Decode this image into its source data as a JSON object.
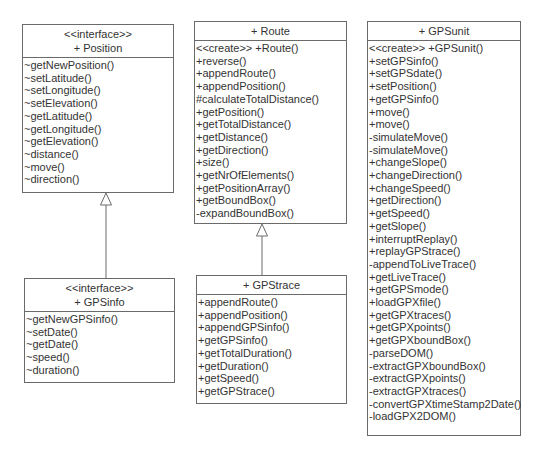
{
  "classes": {
    "position": {
      "stereotype": "<<interface>>",
      "name": "+ Position",
      "operations": [
        "~getNewPosition()",
        "~setLatitude()",
        "~setLongitude()",
        "~setElevation()",
        "~getLatitude()",
        "~getLongitude()",
        "~getElevation()",
        "~distance()",
        "~move()",
        "~direction()"
      ]
    },
    "gpsinfo": {
      "stereotype": "<<interface>>",
      "name": "+ GPSinfo",
      "operations": [
        "~getNewGPSinfo()",
        "~setDate()",
        "~getDate()",
        "~speed()",
        "~duration()"
      ]
    },
    "route": {
      "name": "+ Route",
      "operations": [
        "<<create>> +Route()",
        "+reverse()",
        "+appendRoute()",
        "+appendPosition()",
        "#calculateTotalDistance()",
        "+getPosition()",
        "+getTotalDistance()",
        "+getDistance()",
        "+getDirection()",
        "+size()",
        "+getNrOfElements()",
        "+getPositionArray()",
        "+getBoundBox()",
        "-expandBoundBox()"
      ]
    },
    "gpstrace": {
      "name": "+ GPStrace",
      "operations": [
        "+appendRoute()",
        "+appendPosition()",
        "+appendGPSinfo()",
        "+getGPSinfo()",
        "+getTotalDuration()",
        "+getDuration()",
        "+getSpeed()",
        "+getGPStrace()"
      ]
    },
    "gpsunit": {
      "name": "+ GPSunit",
      "operations": [
        "<<create>> +GPSunit()",
        "+setGPSinfo()",
        "+setGPSdate()",
        "+setPosition()",
        "+getGPSinfo()",
        "+move()",
        "+move()",
        "-simulateMove()",
        "-simulateMove()",
        "+changeSlope()",
        "+changeDirection()",
        "+changeSpeed()",
        "+getDirection()",
        "+getSpeed()",
        "+getSlope()",
        "+interruptReplay()",
        "+replayGPStrace()",
        "-appendToLiveTrace()",
        "+getLiveTrace()",
        "+getGPSmode()",
        "+loadGPXfile()",
        "+getGPXtraces()",
        "+getGPXpoints()",
        "+getGPXboundBox()",
        "-parseDOM()",
        "-extractGPXboundBox()",
        "-extractGPXpoints()",
        "-extractGPXtraces()",
        "-convertGPXtimeStamp2Date()",
        "-loadGPX2DOM()"
      ]
    }
  },
  "relations": [
    {
      "type": "generalization",
      "from": "GPSinfo",
      "to": "Position"
    },
    {
      "type": "generalization",
      "from": "GPStrace",
      "to": "Route"
    }
  ]
}
